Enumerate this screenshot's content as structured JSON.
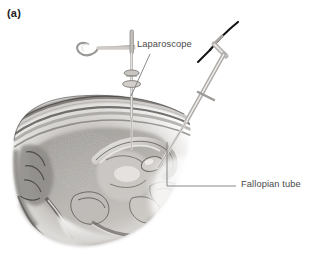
{
  "figure": {
    "panel_label": "(a)",
    "background_color": "#ffffff",
    "label_color": "#4a4a4a",
    "panel_label_color": "#1b1b1b",
    "width": 317,
    "height": 254,
    "style": "grayscale pen-and-ink medical illustration"
  },
  "annotations": [
    {
      "id": "laparoscope",
      "text": "Laparoscope",
      "leader": "diagonal line descending from the lower-left of the text to the laparoscope shaft entering the abdominal wall"
    },
    {
      "id": "fallopian-tube",
      "text": "Fallopian tube",
      "leader": "elbowed line running left from the text then turning upward to the fallopian tube inside the pelvis"
    }
  ],
  "instruments": [
    {
      "id": "uterine-manipulator",
      "description": "instrument with a ring loop handle, horizontal shaft and vertical needle with a collar, entering the abdomen at the left"
    },
    {
      "id": "laparoscope",
      "description": "angled laparoscope shaft with a dark fibre-optic light cable curving away to the upper right"
    }
  ],
  "anatomy": [
    "abdominal wall",
    "uterus",
    "fallopian tube",
    "ovary",
    "bladder",
    "rectum",
    "vagina",
    "pelvic floor",
    "sacrum",
    "bowel loops"
  ],
  "palette": {
    "tissue_light": "#d9d6d2",
    "tissue_mid": "#9e9b98",
    "tissue_dark": "#5d5b59",
    "tissue_deep": "#333130",
    "instrument": "#b9b7b4",
    "instrument_outline": "#8a8886",
    "cable": "#141414",
    "leader_line": "#7d7d7d"
  }
}
